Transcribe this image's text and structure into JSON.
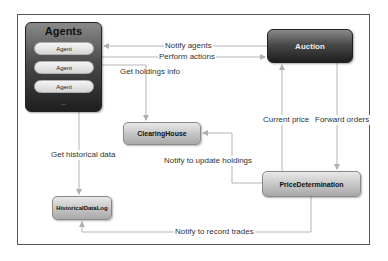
{
  "diagram": {
    "nodes": {
      "agents": {
        "title": "Agents",
        "items": [
          "Agent",
          "Agent",
          "Agent"
        ],
        "more": "..."
      },
      "auction": {
        "label": "Auction"
      },
      "clearing_house": {
        "label": "ClearingHouse"
      },
      "price_determination": {
        "label": "PriceDetermination"
      },
      "historical_data_log": {
        "label": "HistoricalDataLog"
      }
    },
    "edges": {
      "notify_agents": "Notify agents",
      "perform_actions": "Perform actions",
      "get_holdings_info": "Get holdings info",
      "get_historical_data": "Get historical data",
      "current_price": "Current price",
      "forward_orders": "Forward orders",
      "notify_update_holdings": "Notify to update holdings",
      "notify_record_trades": "Notify to record trades"
    },
    "colors": {
      "line": "#b5b5b5",
      "frame": "#555555"
    }
  }
}
